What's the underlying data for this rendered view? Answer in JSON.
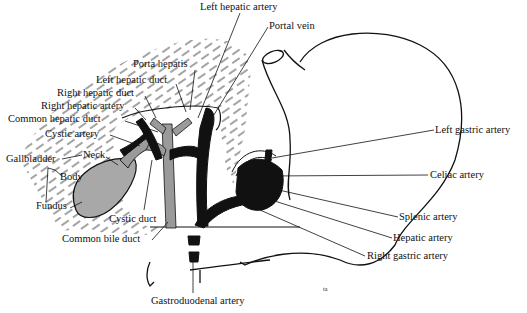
{
  "diagram": {
    "type": "anatomical illustration",
    "signature": "ta",
    "colors": {
      "ink": "#111111",
      "duct_gray": "#9a9a9a",
      "gallbladder_gray": "#a8a8a8",
      "hatch": "#333333"
    },
    "labels": [
      {
        "id": "left-hepatic-artery",
        "text": "Left hepatic artery",
        "x": 200,
        "y": 2
      },
      {
        "id": "portal-vein",
        "text": "Portal vein",
        "x": 269,
        "y": 21
      },
      {
        "id": "porta-hepatis",
        "text": "Porta hepatis",
        "x": 133,
        "y": 59
      },
      {
        "id": "left-hepatic-duct",
        "text": "Left hepatic duct",
        "x": 96,
        "y": 75
      },
      {
        "id": "right-hepatic-duct",
        "text": "Right hepatic duct",
        "x": 57,
        "y": 88
      },
      {
        "id": "right-hepatic-artery",
        "text": "Right hepatic artery",
        "x": 41,
        "y": 101
      },
      {
        "id": "common-hepatic-duct",
        "text": "Common hepatic duct",
        "x": 8,
        "y": 114
      },
      {
        "id": "cystic-artery",
        "text": "Cystic artery",
        "x": 45,
        "y": 129
      },
      {
        "id": "gallbladder",
        "text": "Gallbladder",
        "x": 6,
        "y": 154
      },
      {
        "id": "neck",
        "text": "Neck",
        "x": 83,
        "y": 150
      },
      {
        "id": "body",
        "text": "Body",
        "x": 60,
        "y": 172
      },
      {
        "id": "fundus",
        "text": "Fundus",
        "x": 36,
        "y": 201
      },
      {
        "id": "cystic-duct",
        "text": "Cystic duct",
        "x": 109,
        "y": 214
      },
      {
        "id": "common-bile-duct",
        "text": "Common bile duct",
        "x": 62,
        "y": 234
      },
      {
        "id": "left-gastric-artery",
        "text": "Left gastric artery",
        "x": 435,
        "y": 125
      },
      {
        "id": "celiac-artery",
        "text": "Celiac artery",
        "x": 430,
        "y": 170
      },
      {
        "id": "splenic-artery",
        "text": "Splenic artery",
        "x": 399,
        "y": 212
      },
      {
        "id": "hepatic-artery",
        "text": "Hepatic artery",
        "x": 393,
        "y": 233
      },
      {
        "id": "right-gastric-artery",
        "text": "Right gastric artery",
        "x": 367,
        "y": 251
      },
      {
        "id": "gastroduodenal-artery",
        "text": "Gastroduodenal artery",
        "x": 151,
        "y": 296
      }
    ]
  }
}
